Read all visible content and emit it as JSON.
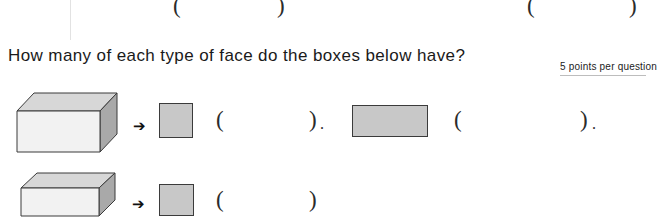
{
  "worksheet": {
    "question": "How many of each type of face do the boxes below have?",
    "points_note": "5 points per question",
    "paren_open": "(",
    "paren_close": ")",
    "period": ".",
    "arrow": "➔",
    "top_row_parens": [
      {
        "open": "(",
        "close": ")"
      },
      {
        "open": "(",
        "close": ")"
      }
    ],
    "rows": [
      {
        "shape_name": "rectangular-prism-long",
        "answers": [
          {
            "face_name": "square-face",
            "open": "(",
            "close": ")",
            "trailing": "."
          },
          {
            "face_name": "rectangular-face",
            "open": "(",
            "close": ")",
            "trailing": "."
          }
        ]
      },
      {
        "shape_name": "rectangular-prism-flat",
        "answers": [
          {
            "face_name": "square-face",
            "open": "(",
            "close": ")",
            "trailing": ""
          }
        ]
      }
    ],
    "colors": {
      "face_fill": "#c8c8c8",
      "shape_top": "#d8d8d8",
      "shape_side": "#a9a9a9",
      "shape_front": "#f0f0f0",
      "outline": "#3b3b3b",
      "text": "#1a1a1a"
    }
  }
}
